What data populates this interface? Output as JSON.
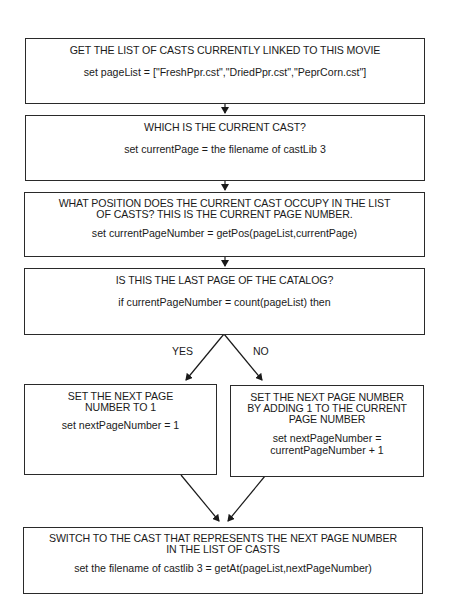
{
  "flowchart": {
    "steps": [
      {
        "heading": "GET THE LIST OF CASTS CURRENTLY LINKED TO THIS MOVIE",
        "code": "set pageList = [\"FreshPpr.cst\",\"DriedPpr.cst\",\"PeprCorn.cst\"]"
      },
      {
        "heading": "WHICH IS THE CURRENT CAST?",
        "code": "set currentPage = the filename of castLib 3"
      },
      {
        "heading_line1": "WHAT POSITION DOES THE CURRENT CAST OCCUPY IN THE LIST",
        "heading_line2": "OF CASTS? THIS IS THE CURRENT PAGE NUMBER.",
        "code": "set currentPageNumber = getPos(pageList,currentPage)"
      },
      {
        "heading": "IS THIS THE LAST PAGE OF THE CATALOG?",
        "code": "if currentPageNumber = count(pageList) then"
      }
    ],
    "branch_labels": {
      "yes": "YES",
      "no": "NO"
    },
    "yes_branch": {
      "heading_line1": "SET THE NEXT PAGE",
      "heading_line2": "NUMBER TO 1",
      "code": "set nextPageNumber = 1"
    },
    "no_branch": {
      "heading_line1": "SET THE NEXT PAGE NUMBER",
      "heading_line2": "BY ADDING 1 TO THE CURRENT",
      "heading_line3": "PAGE NUMBER",
      "code_line1": "set nextPageNumber =",
      "code_line2": "currentPageNumber + 1"
    },
    "final_step": {
      "heading_line1": "SWITCH TO THE CAST THAT REPRESENTS THE NEXT PAGE NUMBER",
      "heading_line2": "IN THE LIST OF CASTS",
      "code": "set the filename of castlib 3 = getAt(pageList,nextPageNumber)"
    }
  }
}
